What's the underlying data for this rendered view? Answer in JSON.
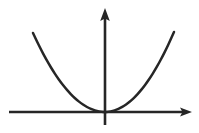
{
  "figure": {
    "kind": "cartesian-axes-plot",
    "title": "",
    "caption": "",
    "background_color": "#ffffff",
    "width": 199,
    "height": 133
  },
  "chart_data": {
    "type": "line",
    "title": "",
    "subtitle": "",
    "xlabel": "",
    "ylabel": "",
    "annotations": [],
    "legend": {
      "visible": false,
      "position": "none",
      "entries": []
    },
    "grid": false,
    "tick_labels": {
      "x": [],
      "y": []
    },
    "axes": {
      "style": "arrow-terminated",
      "origin_px": [
        105,
        112
      ],
      "x_axis": {
        "label": "",
        "visible": true,
        "start_px": [
          9,
          112
        ],
        "end_px": [
          192,
          112
        ],
        "arrow_start": false,
        "arrow_end": true,
        "color": "#262626",
        "width_px": 2.6
      },
      "y_axis": {
        "label": "",
        "visible": true,
        "start_px": [
          105,
          125
        ],
        "end_px": [
          105,
          8
        ],
        "arrow_start": false,
        "arrow_end": true,
        "color": "#262626",
        "width_px": 2.6
      }
    },
    "series": [
      {
        "name": "parabola",
        "equation": "y = a*x^2",
        "color": "#262626",
        "stroke_width_px": 2.5,
        "vertex_px": [
          105,
          112
        ],
        "left_end_px": [
          33,
          33
        ],
        "right_end_px": [
          174,
          32
        ],
        "opens": "up",
        "x": [
          -72,
          -60,
          -48,
          -36,
          -24,
          -12,
          0,
          12,
          24,
          36,
          48,
          60,
          69
        ],
        "values": [
          79,
          55,
          35,
          20,
          9,
          2,
          0,
          2,
          9,
          20,
          35,
          55,
          80
        ]
      }
    ],
    "xlim": [
      -96,
      87
    ],
    "ylim": [
      -13,
      104
    ]
  },
  "colors": {
    "ink": "#262626",
    "ink_soft": "#333333",
    "background": "#ffffff"
  }
}
